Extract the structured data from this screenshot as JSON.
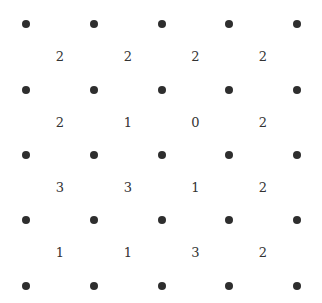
{
  "puzzle": {
    "type": "slitherlink",
    "rows": 4,
    "cols": 4,
    "dot_x": [
      26,
      94,
      162,
      229,
      297
    ],
    "dot_y": [
      24,
      90,
      155,
      220,
      286
    ],
    "clues": [
      [
        "2",
        "2",
        "2",
        "2"
      ],
      [
        "2",
        "1",
        "0",
        "2"
      ],
      [
        "3",
        "3",
        "1",
        "2"
      ],
      [
        "1",
        "1",
        "3",
        "2"
      ]
    ],
    "colors": {
      "dot": "#2e2e2e",
      "text": "#333333",
      "background": "#ffffff"
    }
  }
}
